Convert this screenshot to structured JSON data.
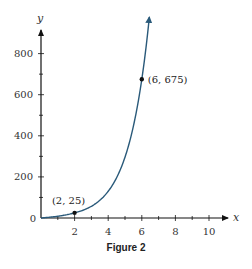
{
  "figure": {
    "caption": "Figure 2"
  },
  "chart_data": {
    "type": "line",
    "title": "",
    "xlabel": "x",
    "ylabel": "y",
    "xlim": [
      0,
      11
    ],
    "ylim": [
      0,
      900
    ],
    "x_ticks": [
      2,
      4,
      6,
      8,
      10
    ],
    "x_minor_ticks": [
      1,
      3,
      5,
      7,
      9
    ],
    "y_ticks": [
      200,
      400,
      600,
      800
    ],
    "y_minor_ticks": [
      100,
      300,
      500,
      700
    ],
    "origin_label": "0",
    "grid": false,
    "legend": null,
    "series": [
      {
        "name": "exponential curve",
        "function": "y = 25 * 3^(x/2)",
        "x": [
          0,
          0.5,
          1,
          1.5,
          2,
          2.5,
          3,
          3.5,
          4,
          4.5,
          5,
          5.5,
          6,
          6.2,
          6.4
        ],
        "values": [
          8.3,
          10.9,
          14.4,
          18.9,
          25,
          32.9,
          43.3,
          57,
          75,
          98.7,
          129.9,
          170.9,
          225,
          600,
          675
        ],
        "color": "#2a5a7a",
        "end_arrow": true
      }
    ],
    "points": [
      {
        "x": 2,
        "y": 25,
        "label": "(2, 25)"
      },
      {
        "x": 6,
        "y": 675,
        "label": "(6, 675)"
      }
    ]
  }
}
